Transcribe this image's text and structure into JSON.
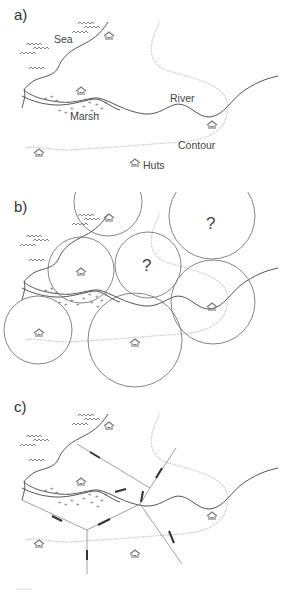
{
  "panels": [
    {
      "id": "a",
      "label": "a)",
      "labels": {
        "sea": "Sea",
        "marsh": "Marsh",
        "river": "River",
        "contour": "Contour",
        "huts": "Huts"
      }
    },
    {
      "id": "b",
      "label": "b)",
      "unknown_marks": [
        "?",
        "?"
      ]
    },
    {
      "id": "c",
      "label": "c)"
    }
  ],
  "legend_semantics": {
    "sea": "wave-symbols",
    "marsh": "plus-dot-symbols",
    "hut": "hut-icon",
    "contour": "dotted-gray-line",
    "river": "double/single dark line",
    "territory": "circles (b) and boundary lines (c)"
  },
  "colors": {
    "line": "#555555",
    "contour": "#c8c8c8",
    "circle": "#777777",
    "hut": "#777777",
    "boundary": "#666666",
    "boundary_thick": "#333333"
  }
}
